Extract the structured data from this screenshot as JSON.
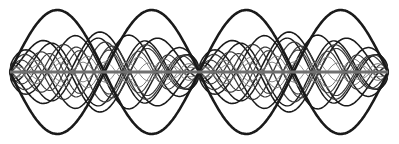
{
  "diagram": {
    "title": "",
    "colors": {
      "background": "#ffffff",
      "strong": "#1a1a1a",
      "medium": "#3a3a3a",
      "light": "#7a7a7a",
      "axis": "#707070"
    },
    "axis": {
      "y": 72,
      "x_start": 10,
      "x_end": 388,
      "stroke_width": 3
    },
    "panels": [
      {
        "x0": 10,
        "x1": 199
      },
      {
        "x0": 199,
        "x1": 388
      }
    ],
    "fundamental": {
      "amplitude": 62,
      "half_period": 94.5,
      "stroke_width": 2.6
    },
    "inner_curves": [
      {
        "amplitude": 40,
        "half_period": 60,
        "phase": 0,
        "stroke": "strong",
        "width": 1.6
      },
      {
        "amplitude": 38,
        "half_period": 55,
        "phase": 18,
        "stroke": "strong",
        "width": 1.5
      },
      {
        "amplitude": 34,
        "half_period": 48,
        "phase": 32,
        "stroke": "strong",
        "width": 1.4
      },
      {
        "amplitude": 30,
        "half_period": 42,
        "phase": 10,
        "stroke": "medium",
        "width": 1.3
      },
      {
        "amplitude": 26,
        "half_period": 36,
        "phase": 24,
        "stroke": "medium",
        "width": 1.2
      },
      {
        "amplitude": 22,
        "half_period": 30,
        "phase": 6,
        "stroke": "medium",
        "width": 1.1
      },
      {
        "amplitude": 16,
        "half_period": 26,
        "phase": 14,
        "stroke": "light",
        "width": 1.0
      },
      {
        "amplitude": 10,
        "half_period": 22,
        "phase": 4,
        "stroke": "light",
        "width": 0.9
      }
    ]
  }
}
